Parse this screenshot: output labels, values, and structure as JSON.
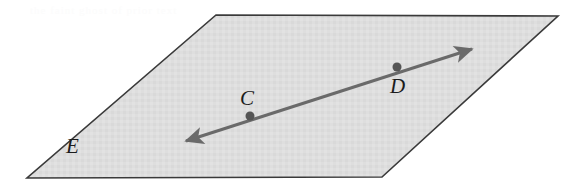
{
  "figure": {
    "type": "geometry-diagram",
    "background_color": "#ffffff"
  },
  "plane": {
    "name": "plane-E",
    "label": "E",
    "fill_color": "#dedede",
    "border_color": "#3a3a3a",
    "border_width": 1.6,
    "vertices": [
      {
        "x": 216,
        "y": 15
      },
      {
        "x": 558,
        "y": 16
      },
      {
        "x": 382,
        "y": 177
      },
      {
        "x": 27,
        "y": 178
      }
    ],
    "label_position": {
      "x": 76,
      "y": 148
    }
  },
  "line": {
    "name": "line-CD",
    "color": "#6a6a6a",
    "width": 3,
    "arrowheads": "both",
    "start": {
      "x": 186,
      "y": 141
    },
    "end": {
      "x": 472,
      "y": 49
    }
  },
  "points": [
    {
      "label": "C",
      "dot": {
        "x": 250,
        "y": 116
      },
      "dot_radius": 4.5,
      "dot_color": "#555555",
      "label_position": {
        "x": 248,
        "y": 100
      },
      "label_placement": "above"
    },
    {
      "label": "D",
      "dot": {
        "x": 397,
        "y": 67
      },
      "dot_radius": 4.5,
      "dot_color": "#555555",
      "label_position": {
        "x": 398,
        "y": 88
      },
      "label_placement": "below"
    }
  ],
  "artifacts": {
    "scan_ghost_text": "the faint ghost of prior text"
  }
}
